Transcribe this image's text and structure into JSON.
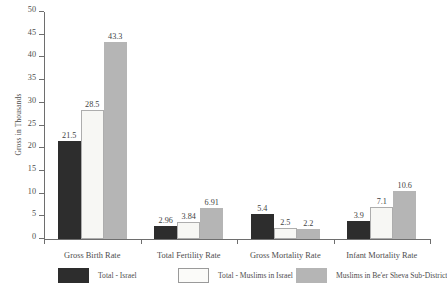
{
  "chart_data": {
    "type": "bar",
    "title": "",
    "xlabel": "",
    "ylabel": "Gross in Thousands",
    "ylim": [
      0,
      50
    ],
    "yticks": [
      0,
      5,
      10,
      15,
      20,
      25,
      30,
      35,
      40,
      45,
      50
    ],
    "ytick_labels": [
      "0",
      "5",
      "10",
      "15",
      "20",
      "25",
      "30",
      "35",
      "40",
      "45",
      "50"
    ],
    "grid": false,
    "legend_position": "bottom",
    "categories": [
      "Gross Birth Rate",
      "Total Fertility Rate",
      "Gross Mortality Rate",
      "Infant Mortality Rate"
    ],
    "series": [
      {
        "name": "Total - Israel",
        "color": "#2d2d2d",
        "values": [
          21.5,
          2.96,
          5.4,
          3.9
        ],
        "labels": [
          "21.5",
          "2.96",
          "5.4",
          "3.9"
        ]
      },
      {
        "name": "Total - Muslims in Israel",
        "color": "#f7f7f4",
        "values": [
          28.5,
          3.84,
          2.5,
          7.1
        ],
        "labels": [
          "28.5",
          "3.84",
          "2.5",
          "7.1"
        ]
      },
      {
        "name": "Muslims in Be'er Sheva Sub-District",
        "color": "#b5b5b5",
        "values": [
          43.3,
          6.91,
          2.2,
          10.6
        ],
        "labels": [
          "43.3",
          "6.91",
          "2.2",
          "10.6"
        ]
      }
    ]
  }
}
